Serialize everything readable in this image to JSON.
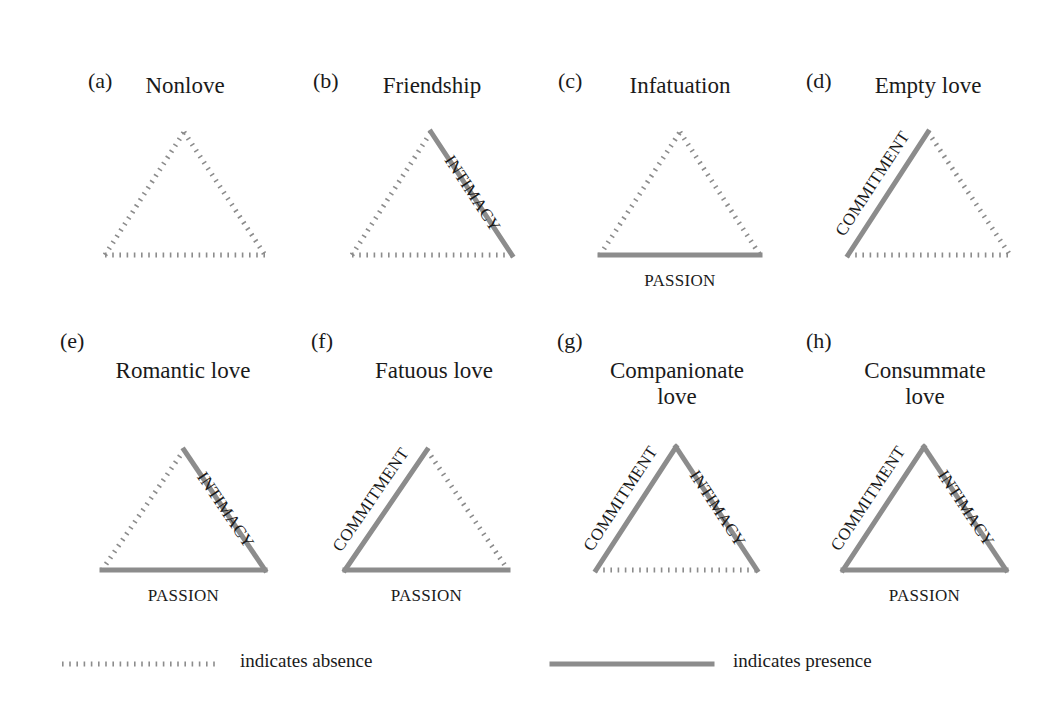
{
  "figure": {
    "colors": {
      "line": "#8c8c8c",
      "text": "#1a1a1a",
      "background": "#ffffff"
    },
    "edge_names": {
      "commitment": "COMMITMENT",
      "intimacy": "INTIMACY",
      "passion": "PASSION"
    },
    "panels": [
      {
        "letter": "(a)",
        "title": "Nonlove",
        "title_lines": [
          "Nonlove"
        ],
        "commitment": false,
        "intimacy": false,
        "passion": false,
        "letter_pos": [
          88,
          70
        ],
        "title_center": [
          185,
          86
        ],
        "apex": [
          184,
          132
        ],
        "left": [
          105,
          255
        ],
        "right": [
          265,
          255
        ]
      },
      {
        "letter": "(b)",
        "title": "Friendship",
        "title_lines": [
          "Friendship"
        ],
        "commitment": false,
        "intimacy": true,
        "passion": false,
        "letter_pos": [
          313,
          70
        ],
        "title_center": [
          432,
          86
        ],
        "apex": [
          431,
          132
        ],
        "left": [
          352,
          255
        ],
        "right": [
          512,
          255
        ]
      },
      {
        "letter": "(c)",
        "title": "Infatuation",
        "title_lines": [
          "Infatuation"
        ],
        "commitment": false,
        "intimacy": false,
        "passion": true,
        "letter_pos": [
          558,
          70
        ],
        "title_center": [
          680,
          86
        ],
        "apex": [
          680,
          132
        ],
        "left": [
          600,
          255
        ],
        "right": [
          760,
          255
        ]
      },
      {
        "letter": "(d)",
        "title": "Empty love",
        "title_lines": [
          "Empty love"
        ],
        "commitment": true,
        "intimacy": false,
        "passion": false,
        "letter_pos": [
          806,
          70
        ],
        "title_center": [
          928,
          86
        ],
        "apex": [
          928,
          132
        ],
        "left": [
          848,
          255
        ],
        "right": [
          1010,
          255
        ]
      },
      {
        "letter": "(e)",
        "title": "Romantic love",
        "title_lines": [
          "Romantic love"
        ],
        "commitment": false,
        "intimacy": true,
        "passion": true,
        "letter_pos": [
          60,
          330
        ],
        "title_center": [
          183,
          371
        ],
        "apex": [
          184,
          450
        ],
        "left": [
          102,
          570
        ],
        "right": [
          265,
          570
        ]
      },
      {
        "letter": "(f)",
        "title": "Fatuous love",
        "title_lines": [
          "Fatuous love"
        ],
        "commitment": true,
        "intimacy": false,
        "passion": true,
        "letter_pos": [
          311,
          330
        ],
        "title_center": [
          434,
          371
        ],
        "apex": [
          427,
          450
        ],
        "left": [
          345,
          570
        ],
        "right": [
          508,
          570
        ]
      },
      {
        "letter": "(g)",
        "title": "Companionate love",
        "title_lines": [
          "Companionate",
          "love"
        ],
        "commitment": true,
        "intimacy": true,
        "passion": false,
        "letter_pos": [
          557,
          330
        ],
        "title_center": [
          677,
          371
        ],
        "apex": [
          676,
          447
        ],
        "left": [
          596,
          570
        ],
        "right": [
          757,
          570
        ]
      },
      {
        "letter": "(h)",
        "title": "Consummate love",
        "title_lines": [
          "Consummate",
          "love"
        ],
        "commitment": true,
        "intimacy": true,
        "passion": true,
        "letter_pos": [
          806,
          330
        ],
        "title_center": [
          925,
          371
        ],
        "apex": [
          924,
          447
        ],
        "left": [
          843,
          570
        ],
        "right": [
          1006,
          570
        ]
      }
    ],
    "legend": {
      "absence": {
        "label": "indicates absence",
        "line": [
          [
            62,
            664
          ],
          [
            218,
            664
          ]
        ],
        "text_pos": [
          240,
          651
        ]
      },
      "presence": {
        "label": "indicates presence",
        "line": [
          [
            552,
            664
          ],
          [
            712,
            664
          ]
        ],
        "text_pos": [
          733,
          651
        ]
      }
    }
  }
}
